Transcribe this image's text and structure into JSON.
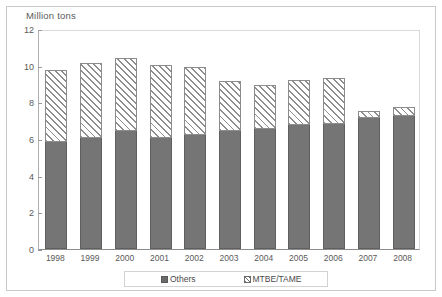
{
  "chart_data": {
    "type": "bar",
    "title": "",
    "subtitle": "",
    "xlabel": "",
    "ylabel": "Million tons",
    "ylim": [
      0,
      12
    ],
    "yticks": [
      "0",
      "2",
      "4",
      "6",
      "8",
      "10",
      "12"
    ],
    "grid": false,
    "stacked": true,
    "legend_position": "bottom",
    "categories": [
      "1998",
      "1999",
      "2000",
      "2001",
      "2002",
      "2003",
      "2004",
      "2005",
      "2006",
      "2007",
      "2008"
    ],
    "series": [
      {
        "name": "Others",
        "values": [
          5.9,
          6.1,
          6.5,
          6.1,
          6.3,
          6.5,
          6.6,
          6.8,
          6.9,
          7.2,
          7.3
        ]
      },
      {
        "name": "MTBE/TAME",
        "values": [
          3.9,
          4.1,
          4.0,
          4.0,
          3.7,
          2.7,
          2.4,
          2.5,
          2.5,
          0.4,
          0.5
        ]
      }
    ],
    "totals": [
      9.8,
      10.2,
      10.5,
      10.1,
      10.0,
      9.2,
      9.0,
      9.3,
      9.4,
      7.6,
      7.8
    ]
  },
  "axis": {
    "y_title": "Million tons",
    "y_ticks": [
      "12",
      "10",
      "8",
      "6",
      "4",
      "2",
      "0"
    ],
    "x_ticks": [
      "1998",
      "1999",
      "2000",
      "2001",
      "2002",
      "2003",
      "2004",
      "2005",
      "2006",
      "2007",
      "2008"
    ]
  },
  "legend": {
    "items": [
      {
        "label": "Others",
        "style": "solid",
        "color": "#757575"
      },
      {
        "label": "MTBE/TAME",
        "style": "hatch",
        "color": "#8e8e8e"
      }
    ]
  },
  "colors": {
    "others_fill": "#757575",
    "mtbe_fill": "#8e8e8e",
    "background": "#ffffff",
    "axis": "#8c8c8c",
    "text": "#5a5a5a"
  }
}
